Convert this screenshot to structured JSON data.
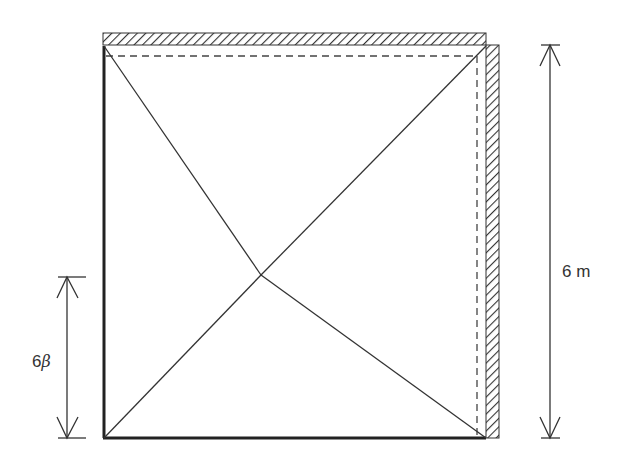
{
  "diagram": {
    "type": "yield-line pattern of square slab",
    "labels": {
      "span": "6 m",
      "offset_num": "6",
      "offset_sym": "β"
    },
    "colors": {
      "line": "#333333",
      "hatch": "#333333",
      "background": "#ffffff"
    },
    "supports": [
      "top edge (hatched, fixed)",
      "right edge (hatched, fixed)"
    ],
    "free_edges": [
      "left edge (thick)",
      "bottom edge (thick)"
    ]
  }
}
